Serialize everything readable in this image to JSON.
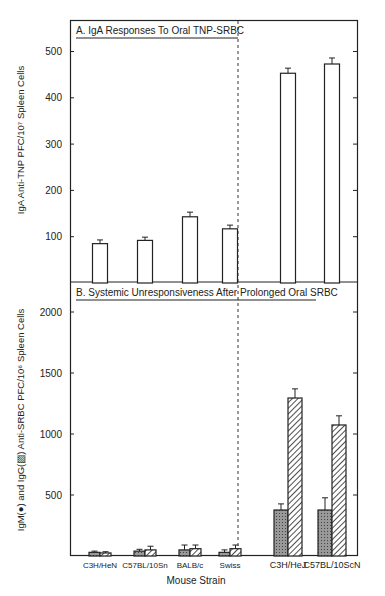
{
  "chart_data": [
    {
      "type": "bar",
      "title": "A. IgA Responses To Oral TNP-SRBC",
      "ylabel": "IgA Anti-TNP PFC/10^7 Spleen Cells",
      "xlabel": "",
      "ylim": [
        0,
        560
      ],
      "yticks": [
        100,
        200,
        300,
        400,
        500
      ],
      "categories": [
        "C3H/HeN",
        "C57BL/10Sn",
        "BALB/c",
        "Swiss",
        "C3H/HeJ",
        "C57BL/10ScN"
      ],
      "values": [
        85,
        92,
        143,
        117,
        453,
        473
      ],
      "errors": [
        8,
        7,
        10,
        8,
        11,
        13
      ],
      "divider_after_index": 3,
      "grid": false
    },
    {
      "type": "bar",
      "title": "B. Systemic Unresponsiveness After Prolonged Oral SRBC",
      "ylabel": "IgM(●) and IgG(▨) Anti-SRBC PFC/10^6 Spleen Cells",
      "xlabel": "Mouse Strain",
      "ylim": [
        0,
        2200
      ],
      "yticks": [
        500,
        1000,
        1500,
        2000
      ],
      "categories": [
        "C3H/HeN",
        "C57BL/10Sn",
        "BALB/c",
        "Swiss",
        "C3H/HeJ",
        "C57BL/10ScN"
      ],
      "series": [
        {
          "name": "IgM",
          "pattern": "stippled",
          "values": [
            30,
            40,
            50,
            30,
            377,
            377
          ],
          "errors": [
            10,
            15,
            40,
            20,
            50,
            100
          ]
        },
        {
          "name": "IgG",
          "pattern": "hatched",
          "values": [
            25,
            50,
            60,
            60,
            1295,
            1074
          ],
          "errors": [
            10,
            30,
            30,
            30,
            75,
            75
          ]
        }
      ],
      "divider_after_index": 3,
      "grid": false
    }
  ],
  "labels": {
    "panel_a_title": "A. IgA Responses To Oral TNP-SRBC",
    "panel_b_title": "B. Systemic Unresponsiveness After Prolonged Oral SRBC",
    "y_a": "IgA Anti-TNP PFC/10⁷  Spleen Cells",
    "y_b": "IgM(●) and IgG(▨) Anti-SRBC PFC/10⁶ Spleen Cells",
    "x": "Mouse Strain",
    "ticks_a": [
      "100",
      "200",
      "300",
      "400",
      "500"
    ],
    "ticks_b": [
      "500",
      "1000",
      "1500",
      "2000"
    ],
    "strains": [
      "C3H/HeN",
      "C57BL/10Sn",
      "BALB/c",
      "Swiss",
      "C3H/HeJ",
      "C57BL/10ScN"
    ]
  }
}
